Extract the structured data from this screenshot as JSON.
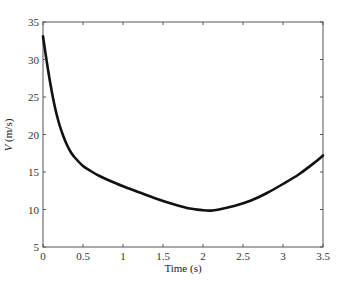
{
  "chart_data": {
    "type": "line",
    "title": "",
    "xlabel": "Time (s)",
    "ylabel_italic": "V",
    "ylabel_rest": " (m/s)",
    "ylabel": "V (m/s)",
    "xlim": [
      0,
      3.5
    ],
    "ylim": [
      5,
      35
    ],
    "xticks": [
      0,
      0.5,
      1,
      1.5,
      2,
      2.5,
      3,
      3.5
    ],
    "xtick_labels": [
      "0",
      "0.5",
      "1",
      "1.5",
      "2",
      "2.5",
      "3",
      "3.5"
    ],
    "yticks": [
      5,
      10,
      15,
      20,
      25,
      30,
      35
    ],
    "ytick_labels": [
      "5",
      "10",
      "15",
      "20",
      "25",
      "30",
      "35"
    ],
    "grid": false,
    "legend": null,
    "series": [
      {
        "name": "V",
        "color": "#111111",
        "x": [
          0,
          0.05,
          0.1,
          0.15,
          0.2,
          0.25,
          0.3,
          0.35,
          0.4,
          0.5,
          0.6,
          0.7,
          0.8,
          1.0,
          1.2,
          1.4,
          1.6,
          1.8,
          2.0,
          2.1,
          2.2,
          2.4,
          2.6,
          2.8,
          3.0,
          3.2,
          3.4,
          3.5
        ],
        "y": [
          33.1,
          29.5,
          26.3,
          23.6,
          21.5,
          19.9,
          18.6,
          17.6,
          16.9,
          15.8,
          15.1,
          14.5,
          14.0,
          13.1,
          12.3,
          11.5,
          10.8,
          10.2,
          9.9,
          9.85,
          10.0,
          10.5,
          11.2,
          12.2,
          13.4,
          14.7,
          16.3,
          17.2
        ]
      }
    ]
  }
}
